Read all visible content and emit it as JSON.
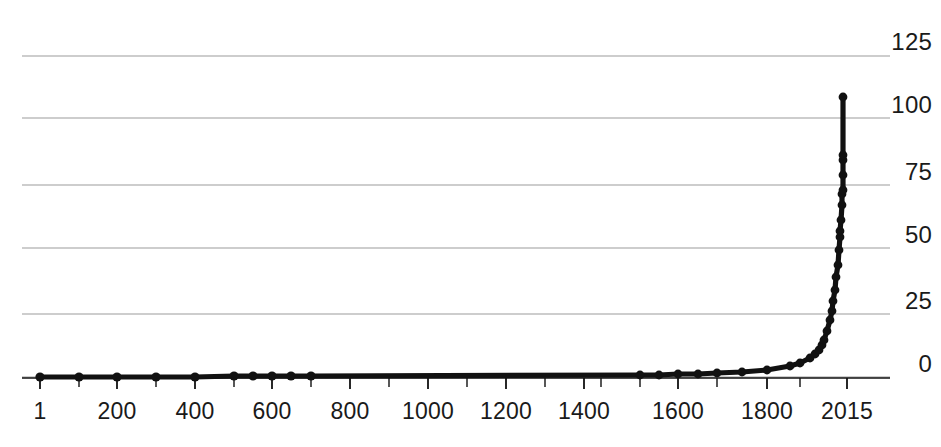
{
  "chart_data": {
    "type": "line",
    "title": "",
    "subtitle": "",
    "xlabel": "",
    "ylabel": "",
    "grid": true,
    "legend": null,
    "xlim": [
      1,
      2015
    ],
    "ylim": [
      0,
      125
    ],
    "x_scale": "nonlinear-compressed",
    "y_ticks": [
      125,
      100,
      75,
      50,
      25,
      0
    ],
    "y_tick_labels": [
      "125",
      "100",
      "75",
      "50",
      "25",
      "0"
    ],
    "x_ticks": [
      1,
      200,
      400,
      600,
      800,
      1000,
      1200,
      1400,
      1600,
      1800,
      2015
    ],
    "x_tick_labels": [
      "1",
      "200",
      "400",
      "600",
      "800",
      "1000",
      "1200",
      "1400",
      "1600",
      "1800",
      "2015"
    ],
    "x_minor_ticks": [
      100,
      300,
      500,
      700,
      900,
      1100,
      1300,
      1500,
      1700,
      1900
    ],
    "marker": "circle",
    "marker_color": "#111111",
    "line_color": "#111111",
    "grid_color": "#bdbdbd",
    "axis_color": "#111111",
    "series": [
      {
        "name": "Population",
        "x": [
          1,
          200,
          400,
          600,
          800,
          1000,
          1100,
          1200,
          1300,
          1400,
          1500,
          1550,
          1600,
          1650,
          1700,
          1750,
          1800,
          1850,
          1875,
          1900,
          1910,
          1920,
          1927,
          1930,
          1940,
          1950,
          1955,
          1960,
          1965,
          1970,
          1974,
          1980,
          1985,
          1987,
          1990,
          1995,
          1999,
          2000,
          2005,
          2010,
          2011,
          2015
        ],
        "values": [
          1.7,
          1.9,
          1.9,
          2.0,
          2.2,
          2.5,
          2.8,
          3.2,
          3.6,
          3.5,
          4.2,
          4.8,
          5.5,
          5.8,
          6.1,
          7.3,
          9.0,
          12.0,
          14.0,
          16.5,
          17.5,
          18.6,
          20.0,
          20.7,
          22.7,
          25.5,
          27.7,
          30.3,
          33.2,
          36.9,
          40.0,
          44.5,
          48.5,
          50.0,
          53.2,
          57.5,
          60.0,
          61.2,
          65.1,
          69.0,
          70.0,
          73.5
        ]
      }
    ],
    "series_display": [
      {
        "name": "Population",
        "px": [
          {
            "x": 40,
            "y": 377
          },
          {
            "x": 79,
            "y": 377
          },
          {
            "x": 117,
            "y": 377
          },
          {
            "x": 156,
            "y": 377
          },
          {
            "x": 195,
            "y": 377
          },
          {
            "x": 234,
            "y": 376
          },
          {
            "x": 253,
            "y": 376
          },
          {
            "x": 272,
            "y": 376
          },
          {
            "x": 291,
            "y": 376
          },
          {
            "x": 311,
            "y": 376
          },
          {
            "x": 640,
            "y": 375
          },
          {
            "x": 659,
            "y": 375
          },
          {
            "x": 678,
            "y": 374
          },
          {
            "x": 698,
            "y": 374
          },
          {
            "x": 717,
            "y": 373
          },
          {
            "x": 742,
            "y": 372
          },
          {
            "x": 767,
            "y": 370
          },
          {
            "x": 790,
            "y": 366
          },
          {
            "x": 800,
            "y": 363
          },
          {
            "x": 810,
            "y": 358
          },
          {
            "x": 815,
            "y": 354
          },
          {
            "x": 819,
            "y": 350
          },
          {
            "x": 822,
            "y": 345
          },
          {
            "x": 824,
            "y": 340
          },
          {
            "x": 827,
            "y": 331
          },
          {
            "x": 830,
            "y": 320
          },
          {
            "x": 832,
            "y": 311
          },
          {
            "x": 833,
            "y": 301
          },
          {
            "x": 835,
            "y": 290
          },
          {
            "x": 836,
            "y": 277
          },
          {
            "x": 838,
            "y": 265
          },
          {
            "x": 839,
            "y": 250
          },
          {
            "x": 840,
            "y": 237
          },
          {
            "x": 840,
            "y": 231
          },
          {
            "x": 841,
            "y": 220
          },
          {
            "x": 842,
            "y": 205
          },
          {
            "x": 842,
            "y": 194
          },
          {
            "x": 843,
            "y": 190
          },
          {
            "x": 843,
            "y": 175
          },
          {
            "x": 843,
            "y": 160
          },
          {
            "x": 843,
            "y": 155
          },
          {
            "x": 843,
            "y": 97
          }
        ]
      }
    ]
  },
  "axes": {
    "plot_left": 22,
    "plot_right": 890,
    "baseline_y": 378,
    "gridline_y": [
      56,
      118,
      185,
      248,
      314,
      377
    ],
    "y_label_right": 932,
    "y_label_offsets": [
      30,
      93,
      160,
      223,
      289,
      352
    ],
    "x_label_y": 400,
    "x_tick_px": [
      40,
      79,
      117,
      156,
      195,
      234,
      272,
      311,
      350,
      389,
      428,
      467,
      506,
      545,
      584,
      601,
      640,
      678,
      717,
      767,
      800,
      847
    ],
    "x_major_px": [
      40,
      117,
      195,
      272,
      350,
      428,
      506,
      584,
      678,
      767,
      847
    ]
  }
}
